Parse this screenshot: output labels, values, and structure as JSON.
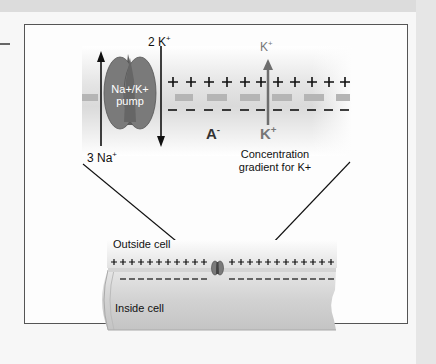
{
  "diagram": {
    "zoom_panel": {
      "pump_label_line1": "Na+/K+",
      "pump_label_line2": "pump",
      "k_out_label": "2 K+",
      "na_out_label": "3 Na+",
      "anion_label": "A-",
      "k_inside_label": "K+",
      "k_outside_label": "K+",
      "gradient_label_line1": "Concentration",
      "gradient_label_line2": "gradient for K+",
      "outside_charge": "+",
      "inside_charge": "-"
    },
    "axon_panel": {
      "outside_label": "Outside cell",
      "inside_label": "Inside cell"
    },
    "colors": {
      "pump_fill": "#7a7a7a",
      "pump_center": "#5e5e5e",
      "membrane_band": "#b5b5b5",
      "arrow_gray": "#6e6e6e",
      "frame_border": "#555555"
    }
  }
}
